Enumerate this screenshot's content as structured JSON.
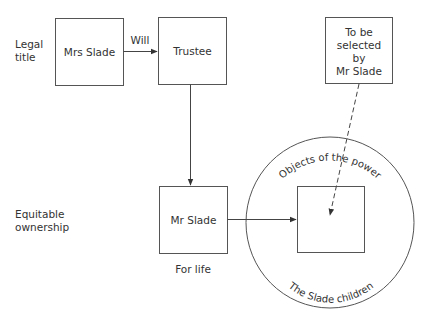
{
  "diagram": {
    "row_labels": {
      "legal_title": [
        "Legal",
        "title"
      ],
      "equitable_ownership": [
        "Equitable",
        "ownership"
      ]
    },
    "nodes": {
      "mrs_slade": {
        "label": "Mrs Slade"
      },
      "trustee": {
        "label": "Trustee"
      },
      "selected_by": {
        "lines": [
          "To be",
          "selected",
          "by",
          "Mr Slade"
        ]
      },
      "mr_slade": {
        "label": "Mr Slade"
      },
      "objects_box": {
        "label": ""
      }
    },
    "edges": {
      "will": {
        "from": "Mrs Slade",
        "to": "Trustee",
        "label": "Will",
        "style": "solid"
      },
      "trustee_to_mr_slade": {
        "from": "Trustee",
        "to": "Mr Slade",
        "style": "solid"
      },
      "mr_slade_to_objects": {
        "from": "Mr Slade",
        "to": "Objects box",
        "style": "solid"
      },
      "selection": {
        "from": "To be selected by Mr Slade",
        "to": "Objects box",
        "style": "dashed"
      }
    },
    "annotations": {
      "for_life": "For life",
      "circle_top": "Objects of the power",
      "circle_bottom": "The Slade children"
    },
    "colors": {
      "stroke": "#555555",
      "text": "#333333",
      "background": "#ffffff"
    }
  }
}
